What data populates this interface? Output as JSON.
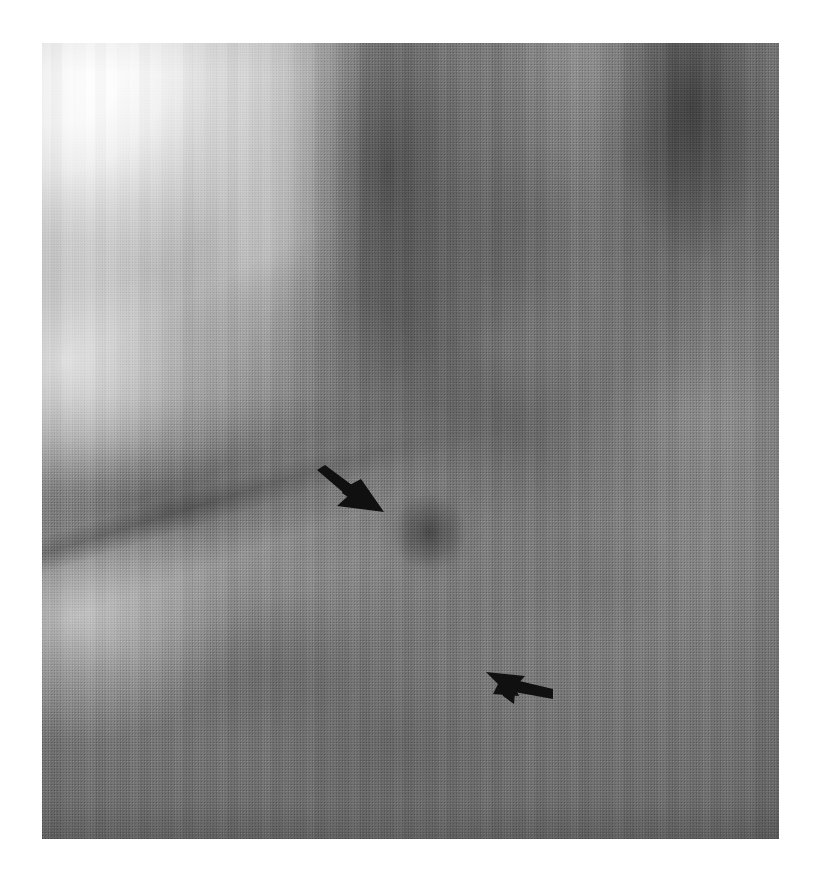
{
  "figure": {
    "kind": "medical-radiograph",
    "modality": "plain film radiograph (halftone print reproduction)",
    "region_depicted": "chest / rib and soft-tissue detail",
    "orientation": "portrait",
    "color_mode": "grayscale",
    "page_background": "#ffffff",
    "caption": "",
    "title": "",
    "panel_label": ""
  },
  "panel": {
    "name": "radiograph-panel",
    "left": 42,
    "top": 43,
    "width": 737,
    "height": 796,
    "base_color": "#8a8a8a",
    "border": "none"
  },
  "tonal_regions": [
    {
      "name": "bright-upper-left-corner",
      "description": "near-white overexposed corner fading diagonally",
      "approx_gray_hex": "#ffffff"
    },
    {
      "name": "dark-upper-right-mass",
      "description": "broad dark soft-tissue shadow upper right",
      "approx_gray_hex": "#3c3c3c"
    },
    {
      "name": "dark-vertical-band-center",
      "description": "dark intercostal band upper centre",
      "approx_gray_hex": "#3f3f3f"
    },
    {
      "name": "dark-vertical-band-top-right",
      "description": "dark intercostal band top right corner",
      "approx_gray_hex": "#3a3a3a"
    },
    {
      "name": "bright-rib-band-left",
      "description": "bright vertical rib band left of centre",
      "approx_gray_hex": "#f2f2f2"
    },
    {
      "name": "bright-rib-band-right",
      "description": "bright vertical rib band on the right upper half",
      "approx_gray_hex": "#e6e6e6"
    },
    {
      "name": "rib-shadow-wedge",
      "description": "large dark diagonal wedge (rib shadow) in left mid field",
      "approx_gray_hex": "#454545"
    },
    {
      "name": "rib-cortex-bright-edge",
      "description": "bright curved cortical margin beneath the wedge",
      "approx_gray_hex": "#fafafa"
    },
    {
      "name": "lower-field-gray",
      "description": "broad homogeneous mid-gray lower two thirds",
      "approx_gray_hex": "#858585"
    },
    {
      "name": "diagonal-linear-opacity",
      "description": "faint dark linear structure running from upper-left to lower-right that both arrows indicate",
      "approx_gray_hex": "#4a4a4a"
    },
    {
      "name": "focal-lesion",
      "description": "small focal dark density at the tip of the upper arrow",
      "approx_gray_hex": "#2a2a2a"
    }
  ],
  "annotations": {
    "arrow_color": "#101010",
    "count": 2,
    "items": [
      {
        "name": "arrow-upper",
        "label": "",
        "direction": "down-right",
        "bearing_degrees": 145,
        "style": "solid barbed arrow",
        "tip_x": 384,
        "tip_y": 512,
        "tail_x": 318,
        "tail_y": 470,
        "points_at": "focal dark density on the diagonal linear structure"
      },
      {
        "name": "arrow-lower",
        "label": "",
        "direction": "up-left",
        "bearing_degrees": 325,
        "style": "solid barbed arrow",
        "tip_x": 486,
        "tip_y": 671,
        "tail_x": 554,
        "tail_y": 706,
        "points_at": "lower extent of the diagonal linear structure"
      }
    ]
  },
  "texture": {
    "halftone_dot_pitch_px": 3,
    "description": "visible printers halftone screen and film grain across the whole panel"
  }
}
